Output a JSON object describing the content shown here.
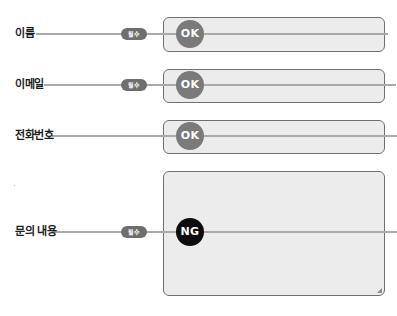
{
  "colors": {
    "box_fill": "#ececec",
    "box_border": "#6f6f6f",
    "connector": "#a9a9a9",
    "badge_bg": "#6e6e6e",
    "ok_bg": "#7a7a7a",
    "ng_bg": "#0d0d0d",
    "label_text": "#1c1c1c"
  },
  "fields": [
    {
      "label": "이름",
      "required_badge": "필수",
      "status": "OK"
    },
    {
      "label": "이메일",
      "required_badge": "필수",
      "status": "OK"
    },
    {
      "label": "전화번호",
      "required_badge": null,
      "status": "OK"
    },
    {
      "label": "문의 내용",
      "required_badge": "필수",
      "status": "NG"
    }
  ]
}
